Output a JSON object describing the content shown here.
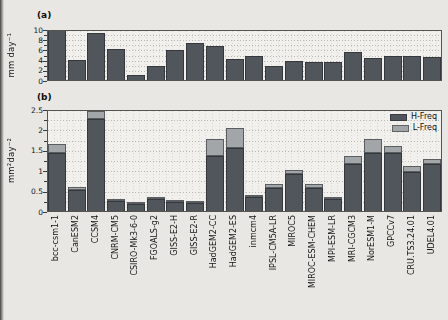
{
  "figure": {
    "panel_a_letter": "(a)",
    "panel_b_letter": "(b)",
    "background": "#e8e7e3",
    "plot_background": "#f1f0ec"
  },
  "colors": {
    "h_freq": "#51565c",
    "l_freq": "#a3a6a9",
    "bar_dark": "#51565c",
    "axis": "#55544f",
    "grid": "#bab9b4"
  },
  "legend": {
    "position": "top-right"
  },
  "chart_data": [
    {
      "type": "bar",
      "panel": "(a)",
      "ylabel": "mm day⁻¹",
      "ylim": [
        0,
        10
      ],
      "yticks": [
        0,
        2,
        4,
        6,
        8,
        10
      ],
      "ytick_labels": [
        "0",
        "2",
        "4",
        "6",
        "8",
        "10"
      ],
      "grid": "dotted",
      "categories": [
        "bcc-csm1-1",
        "CanESM2",
        "CCSM4",
        "CNRM-CM5",
        "CSIRO-Mk3-6-0",
        "FGOALS-g2",
        "GISS-E2-H",
        "GISS-E2-R",
        "HadGEM2-CC",
        "HadGEM2-ES",
        "inmcm4",
        "IPSL-CM5A-LR",
        "MIROC5",
        "MIROC-ESM-CHEM",
        "MPI-ESM-LR",
        "MRI-CGCM3",
        "NorESM1-M",
        "GPCCv7",
        "CRU.TS3.24.01",
        "UDEL4.01"
      ],
      "values": [
        10.0,
        4.2,
        9.5,
        6.2,
        1.1,
        3.0,
        6.0,
        7.4,
        6.8,
        4.3,
        4.9,
        2.9,
        3.9,
        3.8,
        3.7,
        5.6,
        4.6,
        4.9,
        5.0,
        4.7
      ]
    },
    {
      "type": "bar",
      "stacked": true,
      "panel": "(b)",
      "ylabel": "mm²day⁻²",
      "ylim": [
        0,
        2.5
      ],
      "yticks": [
        0,
        0.5,
        1,
        1.5,
        2,
        2.5
      ],
      "ytick_labels": [
        "0",
        "0.5",
        "1",
        "1.5",
        "2",
        "2.5"
      ],
      "grid": "dotted",
      "legend_position": "top-right",
      "categories": [
        "bcc-csm1-1",
        "CanESM2",
        "CCSM4",
        "CNRM-CM5",
        "CSIRO-Mk3-6-0",
        "FGOALS-g2",
        "GISS-E2-H",
        "GISS-E2-R",
        "HadGEM2-CC",
        "HadGEM2-ES",
        "inmcm4",
        "IPSL-CM5A-LR",
        "MIROC5",
        "MIROC-ESM-CHEM",
        "MPI-ESM-LR",
        "MRI-CGCM3",
        "NorESM1-M",
        "GPCCv7",
        "CRU.TS3.24.01",
        "UDEL4.01"
      ],
      "series": [
        {
          "name": "H-Freq",
          "color": "#51565c",
          "values": [
            1.45,
            0.55,
            2.27,
            0.27,
            0.2,
            0.33,
            0.24,
            0.23,
            1.38,
            1.58,
            0.36,
            0.6,
            0.93,
            0.6,
            0.33,
            1.17,
            1.45,
            1.45,
            0.99,
            1.17
          ]
        },
        {
          "name": "L-Freq",
          "color": "#a3a6a9",
          "values": [
            0.21,
            0.07,
            0.2,
            0.05,
            0.04,
            0.05,
            0.04,
            0.03,
            0.4,
            0.47,
            0.06,
            0.08,
            0.09,
            0.08,
            0.05,
            0.2,
            0.35,
            0.17,
            0.14,
            0.12
          ]
        }
      ]
    }
  ]
}
